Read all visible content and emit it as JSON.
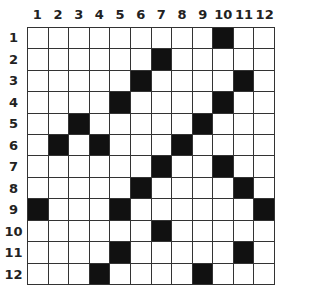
{
  "puzzle": {
    "rows": 12,
    "cols": 12,
    "column_labels": [
      "1",
      "2",
      "3",
      "4",
      "5",
      "6",
      "7",
      "8",
      "9",
      "10",
      "11",
      "12"
    ],
    "row_labels": [
      "1",
      "2",
      "3",
      "4",
      "5",
      "6",
      "7",
      "8",
      "9",
      "10",
      "11",
      "12"
    ],
    "black_cells": [
      [
        1,
        10
      ],
      [
        2,
        7
      ],
      [
        3,
        6
      ],
      [
        3,
        11
      ],
      [
        4,
        5
      ],
      [
        4,
        10
      ],
      [
        5,
        3
      ],
      [
        5,
        9
      ],
      [
        6,
        2
      ],
      [
        6,
        4
      ],
      [
        6,
        8
      ],
      [
        7,
        7
      ],
      [
        7,
        10
      ],
      [
        8,
        6
      ],
      [
        8,
        11
      ],
      [
        9,
        1
      ],
      [
        9,
        5
      ],
      [
        9,
        12
      ],
      [
        10,
        7
      ],
      [
        11,
        5
      ],
      [
        11,
        11
      ],
      [
        12,
        4
      ],
      [
        12,
        9
      ]
    ],
    "colors": {
      "black": "#111111",
      "white": "#ffffff",
      "grid_line": "#333333"
    }
  }
}
